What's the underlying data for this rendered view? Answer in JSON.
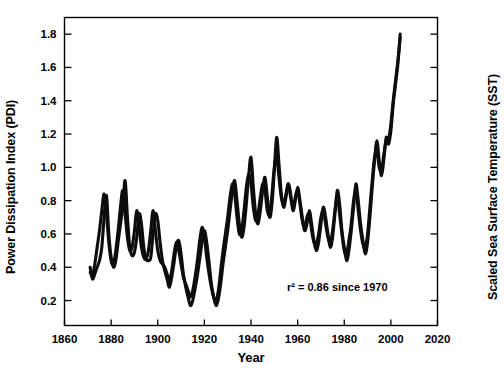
{
  "figure": {
    "background_color": "#ffffff",
    "line_color": "#0d0d0d"
  },
  "labels": {
    "y_left": "Power Dissipation Index (PDI)",
    "y_right": "Scaled Sea Surface Temperature (SST)",
    "x": "Year"
  },
  "annotation": "r² = 0.86 since 1970",
  "chart_data": {
    "type": "line",
    "title": "",
    "xlabel": "Year",
    "ylabel": "Power Dissipation Index (PDI)",
    "ylabel_right": "Scaled Sea Surface Temperature (SST)",
    "xlim": [
      1860,
      2020
    ],
    "ylim": [
      0.05,
      1.9
    ],
    "xticks": [
      1860,
      1880,
      1900,
      1920,
      1940,
      1960,
      1980,
      2000,
      2020
    ],
    "yticks": [
      0.2,
      0.4,
      0.6,
      0.8,
      1.0,
      1.2,
      1.4,
      1.6,
      1.8
    ],
    "yticks_right_count": 9,
    "yticks_right_labels": [],
    "grid": false,
    "legend": null,
    "annotations": [
      {
        "text": "r² = 0.86 since 1970",
        "x": 1977,
        "y": 0.26
      }
    ],
    "series": [
      {
        "name": "Power Dissipation Index (PDI)",
        "color": "#0d0d0d",
        "x": [
          1871,
          1872,
          1873,
          1874,
          1875,
          1876,
          1877,
          1878,
          1879,
          1880,
          1881,
          1882,
          1883,
          1884,
          1885,
          1886,
          1887,
          1888,
          1889,
          1890,
          1891,
          1892,
          1893,
          1894,
          1895,
          1896,
          1897,
          1898,
          1899,
          1900,
          1901,
          1902,
          1903,
          1904,
          1905,
          1906,
          1907,
          1908,
          1909,
          1910,
          1911,
          1912,
          1913,
          1914,
          1915,
          1916,
          1917,
          1918,
          1919,
          1920,
          1921,
          1922,
          1923,
          1924,
          1925,
          1926,
          1927,
          1928,
          1929,
          1930,
          1931,
          1932,
          1933,
          1934,
          1935,
          1936,
          1937,
          1938,
          1939,
          1940,
          1941,
          1942,
          1943,
          1944,
          1945,
          1946,
          1947,
          1948,
          1949,
          1950,
          1951,
          1952,
          1953,
          1954,
          1955,
          1956,
          1957,
          1958,
          1959,
          1960,
          1961,
          1962,
          1963,
          1964,
          1965,
          1966,
          1967,
          1968,
          1969,
          1970,
          1971,
          1972,
          1973,
          1974,
          1975,
          1976,
          1977,
          1978,
          1979,
          1980,
          1981,
          1982,
          1983,
          1984,
          1985,
          1986,
          1987,
          1988,
          1989,
          1990,
          1991,
          1992,
          1993,
          1994,
          1995,
          1996,
          1997,
          1998,
          1999,
          2000,
          2001,
          2002,
          2003,
          2004
        ],
        "values": [
          0.4,
          0.33,
          0.36,
          0.4,
          0.44,
          0.52,
          0.7,
          0.83,
          0.6,
          0.46,
          0.4,
          0.44,
          0.55,
          0.66,
          0.76,
          0.92,
          0.7,
          0.52,
          0.47,
          0.49,
          0.58,
          0.72,
          0.66,
          0.52,
          0.45,
          0.44,
          0.46,
          0.6,
          0.72,
          0.68,
          0.55,
          0.44,
          0.38,
          0.33,
          0.28,
          0.34,
          0.43,
          0.53,
          0.56,
          0.48,
          0.36,
          0.28,
          0.22,
          0.17,
          0.2,
          0.27,
          0.35,
          0.45,
          0.55,
          0.62,
          0.55,
          0.43,
          0.3,
          0.22,
          0.17,
          0.21,
          0.3,
          0.42,
          0.52,
          0.62,
          0.74,
          0.85,
          0.92,
          0.8,
          0.66,
          0.58,
          0.64,
          0.78,
          0.95,
          1.06,
          0.88,
          0.72,
          0.66,
          0.74,
          0.86,
          0.94,
          0.82,
          0.7,
          0.78,
          0.98,
          1.18,
          1.02,
          0.84,
          0.76,
          0.82,
          0.9,
          0.84,
          0.74,
          0.8,
          0.88,
          0.8,
          0.7,
          0.62,
          0.66,
          0.74,
          0.66,
          0.56,
          0.5,
          0.55,
          0.66,
          0.76,
          0.7,
          0.6,
          0.52,
          0.58,
          0.72,
          0.86,
          0.78,
          0.62,
          0.52,
          0.44,
          0.5,
          0.62,
          0.76,
          0.9,
          0.8,
          0.66,
          0.56,
          0.48,
          0.55,
          0.7,
          0.88,
          1.04,
          1.16,
          1.04,
          0.95,
          1.05,
          1.18,
          1.14,
          1.22,
          1.38,
          1.5,
          1.62,
          1.8
        ]
      },
      {
        "name": "Scaled Sea Surface Temperature (SST)",
        "color": "#0d0d0d",
        "x": [
          1871,
          1872,
          1873,
          1874,
          1875,
          1876,
          1877,
          1878,
          1879,
          1880,
          1881,
          1882,
          1883,
          1884,
          1885,
          1886,
          1887,
          1888,
          1889,
          1890,
          1891,
          1892,
          1893,
          1894,
          1895,
          1896,
          1897,
          1898,
          1899,
          1900,
          1901,
          1902,
          1903,
          1904,
          1905,
          1906,
          1907,
          1908,
          1909,
          1910,
          1911,
          1912,
          1913,
          1914,
          1915,
          1916,
          1917,
          1918,
          1919,
          1920,
          1921,
          1922,
          1923,
          1924,
          1925,
          1926,
          1927,
          1928,
          1929,
          1930,
          1931,
          1932,
          1933,
          1934,
          1935,
          1936,
          1937,
          1938,
          1939,
          1940,
          1941,
          1942,
          1943,
          1944,
          1945,
          1946,
          1947,
          1948,
          1949,
          1950,
          1951,
          1952,
          1953,
          1954,
          1955,
          1956,
          1957,
          1958,
          1959,
          1960,
          1961,
          1962,
          1963,
          1964,
          1965,
          1966,
          1967,
          1968,
          1969,
          1970,
          1971,
          1972,
          1973,
          1974,
          1975,
          1976,
          1977,
          1978,
          1979,
          1980,
          1981,
          1982,
          1983,
          1984,
          1985,
          1986,
          1987,
          1988,
          1989,
          1990,
          1991,
          1992,
          1993,
          1994,
          1995,
          1996,
          1997,
          1998,
          1999,
          2000,
          2001,
          2002,
          2003,
          2004
        ],
        "values": [
          0.37,
          0.35,
          0.42,
          0.52,
          0.62,
          0.74,
          0.84,
          0.72,
          0.55,
          0.44,
          0.42,
          0.5,
          0.62,
          0.76,
          0.86,
          0.72,
          0.58,
          0.5,
          0.52,
          0.62,
          0.74,
          0.64,
          0.52,
          0.46,
          0.45,
          0.5,
          0.62,
          0.74,
          0.62,
          0.5,
          0.44,
          0.42,
          0.4,
          0.36,
          0.32,
          0.38,
          0.48,
          0.55,
          0.5,
          0.42,
          0.34,
          0.3,
          0.26,
          0.22,
          0.26,
          0.34,
          0.44,
          0.56,
          0.64,
          0.58,
          0.46,
          0.36,
          0.28,
          0.22,
          0.2,
          0.26,
          0.38,
          0.5,
          0.6,
          0.7,
          0.82,
          0.9,
          0.84,
          0.7,
          0.6,
          0.62,
          0.74,
          0.88,
          0.96,
          0.9,
          0.76,
          0.68,
          0.72,
          0.82,
          0.9,
          0.86,
          0.74,
          0.72,
          0.84,
          1.0,
          1.06,
          0.94,
          0.82,
          0.78,
          0.84,
          0.9,
          0.82,
          0.76,
          0.82,
          0.86,
          0.78,
          0.68,
          0.64,
          0.7,
          0.72,
          0.62,
          0.55,
          0.54,
          0.6,
          0.7,
          0.74,
          0.66,
          0.58,
          0.55,
          0.62,
          0.74,
          0.82,
          0.72,
          0.6,
          0.5,
          0.48,
          0.56,
          0.66,
          0.8,
          0.86,
          0.74,
          0.62,
          0.54,
          0.52,
          0.6,
          0.76,
          0.92,
          1.06,
          1.1,
          1.0,
          0.98,
          1.08,
          1.16,
          1.16,
          1.26,
          1.4,
          1.52,
          1.64,
          1.78
        ]
      }
    ]
  }
}
